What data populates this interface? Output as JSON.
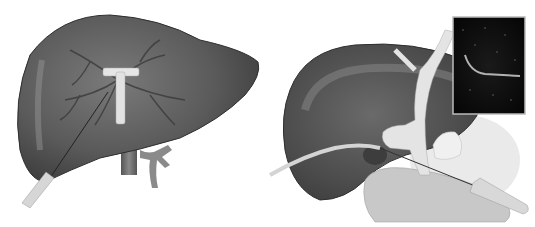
{
  "figure": {
    "panels": [
      {
        "id": "left",
        "subject": "liver with internal vasculature, T-tube device and needle/catheter inserted from lower left",
        "labels": []
      },
      {
        "id": "right",
        "subject": "liver with gallbladder/duct structure, catheter and needle probe, ultrasound inset in top-right",
        "labels": []
      }
    ],
    "colors": {
      "background": "#ffffff",
      "liver_dark": "#4a4a4a",
      "liver_mid": "#6b6b6b",
      "liver_light": "#9a9a9a",
      "device": "#e6e6e6",
      "ultrasound_bg": "#0a0a0a"
    }
  }
}
